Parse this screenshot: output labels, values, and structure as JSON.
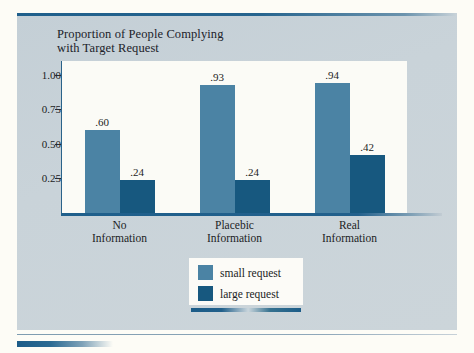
{
  "chart_data": {
    "type": "bar",
    "title": "Proportion of People Complying with Target Request",
    "title_line1": "Proportion of People Complying",
    "title_line2": "with Target Request",
    "xlabel": "",
    "ylabel": "",
    "ylim": [
      0,
      1.1
    ],
    "grid": false,
    "legend_position": "bottom-center",
    "categories": [
      "No Information",
      "Placebic Information",
      "Real Information"
    ],
    "category_lines": [
      [
        "No",
        "Information"
      ],
      [
        "Placebic",
        "Information"
      ],
      [
        "Real",
        "Information"
      ]
    ],
    "ytick_labels": [
      "1.00",
      "0.75",
      "0.50",
      "0.25"
    ],
    "ytick_values": [
      1.0,
      0.75,
      0.5,
      0.25
    ],
    "series": [
      {
        "name": "small request",
        "color": "#4b83a4",
        "values": [
          0.6,
          0.93,
          0.94
        ],
        "value_labels": [
          ".60",
          ".93",
          ".94"
        ]
      },
      {
        "name": "large request",
        "color": "#17587f",
        "values": [
          0.24,
          0.24,
          0.42
        ],
        "value_labels": [
          ".24",
          ".24",
          ".42"
        ]
      }
    ]
  },
  "legend": {
    "items": [
      {
        "label": "small request",
        "color": "#4b83a4"
      },
      {
        "label": "large request",
        "color": "#17587f"
      }
    ]
  },
  "colors": {
    "small_request": "#4b83a4",
    "large_request": "#17587f",
    "panel_background": "#c9d3d9",
    "plot_background": "#fbfbf6",
    "axis": "#1f5f8b",
    "page_background": "#fdfcf6",
    "text": "#1b1d24"
  }
}
